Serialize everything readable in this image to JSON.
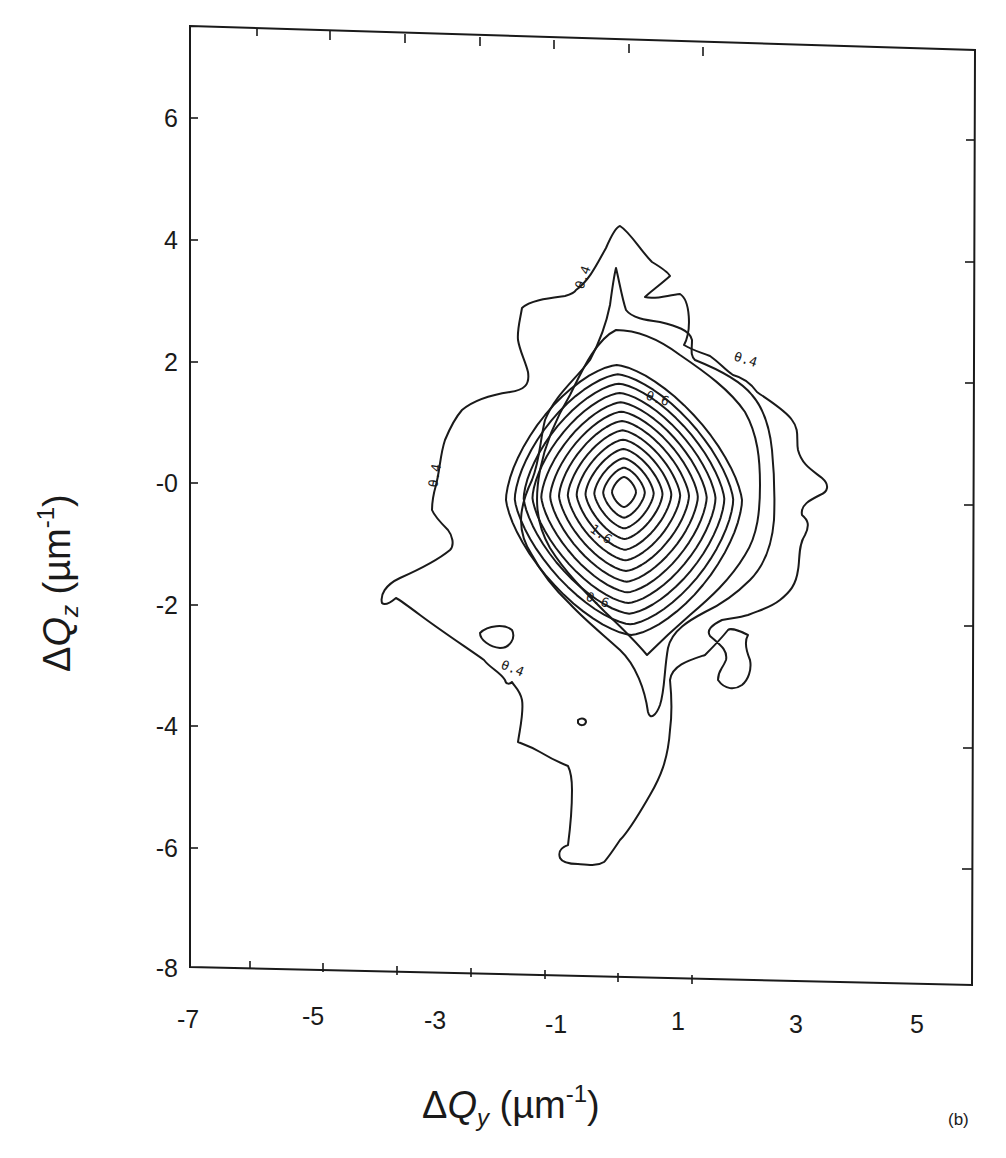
{
  "chart_data": {
    "type": "contour",
    "title": "",
    "xlabel": "ΔQy (µm⁻¹)",
    "ylabel": "ΔQz (µm⁻¹)",
    "xlabel_parts": {
      "delta": "Δ",
      "var": "Q",
      "sub": "y",
      "unit_open": " (µm",
      "sup": "-1",
      "unit_close": ")"
    },
    "ylabel_parts": {
      "delta": "Δ",
      "var": "Q",
      "sub": "z",
      "unit_open": " (µm",
      "sup": "-1",
      "unit_close": ")"
    },
    "xlim": [
      -7,
      6
    ],
    "ylim": [
      -8,
      7.5
    ],
    "x_ticks": [
      "-7",
      "-5",
      "-3",
      "-1",
      "1",
      "3",
      "5"
    ],
    "y_ticks": [
      "6",
      "4",
      "2",
      "-0",
      "-2",
      "-4",
      "-6",
      "-8"
    ],
    "grid": false,
    "contour_labels": [
      "0.4",
      "0.4",
      "0.4",
      "0.4",
      "0.6",
      "0.6",
      "1.6"
    ],
    "contour_label_display": [
      "θ.4",
      "θ.4",
      "θ.4",
      "θ.4",
      "θ.6",
      "θ.6",
      "1.6"
    ],
    "levels_approx": [
      0.4,
      0.5,
      0.6,
      0.7,
      0.8,
      0.9,
      1.0,
      1.1,
      1.2,
      1.3,
      1.4,
      1.5,
      1.6,
      1.7,
      1.8,
      1.9,
      2.0
    ],
    "peak": {
      "x": 0.1,
      "y": -0.2
    },
    "outer_contour_extent": {
      "x": [
        -3.8,
        3.5
      ],
      "y": [
        -6.0,
        4.2
      ]
    },
    "panel_label": "(b)"
  }
}
